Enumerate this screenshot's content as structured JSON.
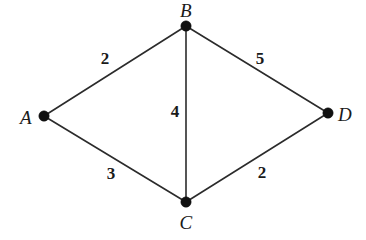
{
  "figure": {
    "type": "weighted-undirected-graph",
    "background_color": "#ffffff",
    "stroke_color": "#2b2b2b",
    "node_color": "#111111",
    "text_color": "#1a1a1a",
    "width": 366,
    "height": 240
  },
  "graph_data": {
    "type": "graph",
    "directed": false,
    "weighted": true,
    "nodes": [
      {
        "id": "A",
        "label": "A",
        "x": 44,
        "y": 116,
        "label_x": 26,
        "label_y": 117,
        "label_pos": "left"
      },
      {
        "id": "B",
        "label": "B",
        "x": 186,
        "y": 26,
        "label_x": 186,
        "label_y": 10,
        "label_pos": "above"
      },
      {
        "id": "C",
        "label": "C",
        "x": 186,
        "y": 202,
        "label_x": 186,
        "label_y": 222,
        "label_pos": "below"
      },
      {
        "id": "D",
        "label": "D",
        "x": 328,
        "y": 113,
        "label_x": 345,
        "label_y": 114,
        "label_pos": "right"
      }
    ],
    "edges": [
      {
        "id": "AB",
        "source": "A",
        "target": "B",
        "weight": "2",
        "label_x": 105,
        "label_y": 58
      },
      {
        "id": "BD",
        "source": "B",
        "target": "D",
        "weight": "5",
        "label_x": 260,
        "label_y": 58
      },
      {
        "id": "BC",
        "source": "B",
        "target": "C",
        "weight": "4",
        "label_x": 175,
        "label_y": 111
      },
      {
        "id": "AC",
        "source": "A",
        "target": "C",
        "weight": "3",
        "label_x": 111,
        "label_y": 173
      },
      {
        "id": "CD",
        "source": "C",
        "target": "D",
        "weight": "2",
        "label_x": 262,
        "label_y": 172
      }
    ],
    "node_radius": 5.2,
    "edge_width": 1.6
  }
}
